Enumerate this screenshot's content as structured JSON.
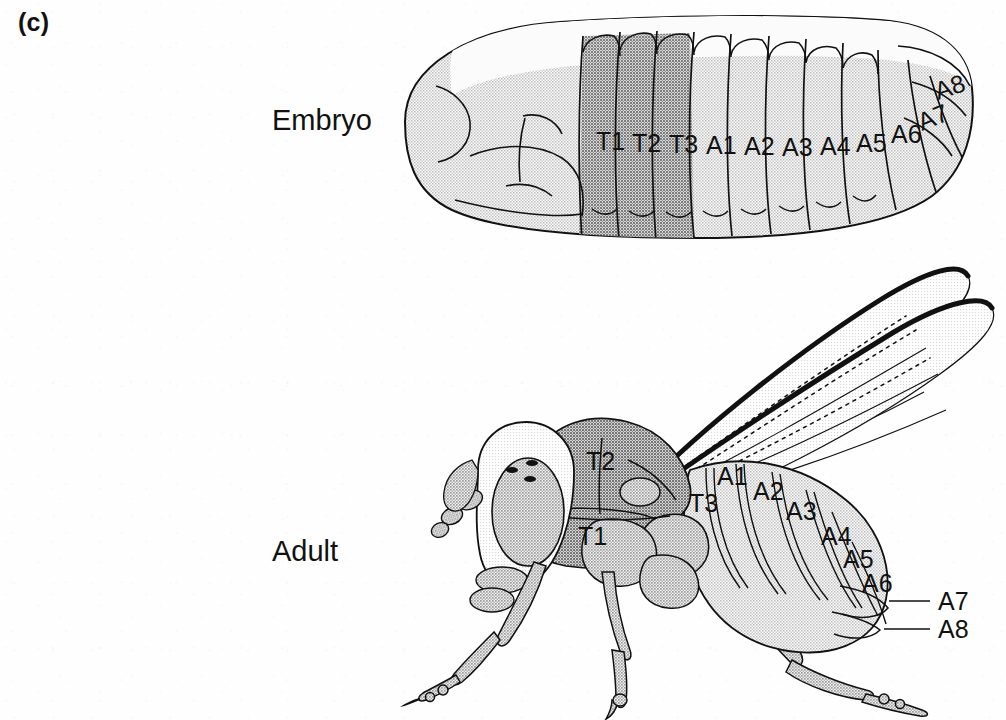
{
  "figure": {
    "panel_letter": "(c)",
    "background_color": "#fefefe",
    "ink_color": "#111111"
  },
  "stages": {
    "embryo": {
      "label": "Embryo",
      "label_x": 272,
      "label_y": 104,
      "shading": {
        "body_tone": "#cfcfcf",
        "thorax_tone": "#a6a6a6",
        "dorsal_band_tone": "#fbfbfb",
        "outline": "#111111"
      },
      "segments": [
        {
          "id": "T1",
          "label": "T1",
          "x": 596,
          "y": 150,
          "group": "thoracic",
          "tone": "dark"
        },
        {
          "id": "T2",
          "label": "T2",
          "x": 632,
          "y": 152,
          "group": "thoracic",
          "tone": "dark"
        },
        {
          "id": "T3",
          "label": "T3",
          "x": 669,
          "y": 153,
          "group": "thoracic",
          "tone": "dark"
        },
        {
          "id": "A1",
          "label": "A1",
          "x": 706,
          "y": 154,
          "group": "abdominal",
          "tone": "light"
        },
        {
          "id": "A2",
          "label": "A2",
          "x": 744,
          "y": 155,
          "group": "abdominal",
          "tone": "light"
        },
        {
          "id": "A3",
          "label": "A3",
          "x": 782,
          "y": 156,
          "group": "abdominal",
          "tone": "light"
        },
        {
          "id": "A4",
          "label": "A4",
          "x": 820,
          "y": 155,
          "group": "abdominal",
          "tone": "light"
        },
        {
          "id": "A5",
          "label": "A5",
          "x": 856,
          "y": 152,
          "group": "abdominal",
          "tone": "light"
        },
        {
          "id": "A6",
          "label": "A6",
          "x": 891,
          "y": 143,
          "group": "abdominal",
          "tone": "light"
        },
        {
          "id": "A7",
          "label": "A7",
          "x": 928,
          "y": 130,
          "group": "abdominal",
          "tone": "light"
        },
        {
          "id": "A8",
          "label": "A8",
          "x": 942,
          "y": 100,
          "group": "abdominal",
          "tone": "light"
        }
      ]
    },
    "adult": {
      "label": "Adult",
      "label_x": 272,
      "label_y": 535,
      "shading": {
        "body_tone": "#cbcbcb",
        "thorax_tone": "#aeaeae",
        "head_tone": "#e2e2e2",
        "eye_tone": "#c0c0c0",
        "wing_tone": "#fcfcfc",
        "outline": "#111111"
      },
      "segments": [
        {
          "id": "T1",
          "label": "T1",
          "x": 578,
          "y": 545,
          "group": "thoracic",
          "leader": false
        },
        {
          "id": "T2",
          "label": "T2",
          "x": 586,
          "y": 470,
          "group": "thoracic",
          "leader": false
        },
        {
          "id": "T3",
          "label": "T3",
          "x": 689,
          "y": 512,
          "group": "thoracic",
          "leader": false
        },
        {
          "id": "A1",
          "label": "A1",
          "x": 717,
          "y": 485,
          "group": "abdominal",
          "leader": false
        },
        {
          "id": "A2",
          "label": "A2",
          "x": 753,
          "y": 500,
          "group": "abdominal",
          "leader": false
        },
        {
          "id": "A3",
          "label": "A3",
          "x": 786,
          "y": 520,
          "group": "abdominal",
          "leader": false
        },
        {
          "id": "A4",
          "label": "A4",
          "x": 821,
          "y": 545,
          "group": "abdominal",
          "leader": false
        },
        {
          "id": "A5",
          "label": "A5",
          "x": 843,
          "y": 568,
          "group": "abdominal",
          "leader": false
        },
        {
          "id": "A6",
          "label": "A6",
          "x": 862,
          "y": 592,
          "group": "abdominal",
          "leader": false
        },
        {
          "id": "A7",
          "label": "A7",
          "x": 938,
          "y": 606,
          "group": "abdominal",
          "leader": true,
          "leader_from_x": 889,
          "leader_from_y": 601,
          "leader_to_x": 930,
          "leader_to_y": 601
        },
        {
          "id": "A8",
          "label": "A8",
          "x": 938,
          "y": 634,
          "group": "abdominal",
          "leader": true,
          "leader_from_x": 884,
          "leader_from_y": 629,
          "leader_to_x": 930,
          "leader_to_y": 629
        }
      ],
      "anatomy": {
        "wings": 2,
        "legs": 3,
        "ocelli": 3,
        "compound_eye": 1,
        "antenna_segments": 4
      }
    }
  }
}
